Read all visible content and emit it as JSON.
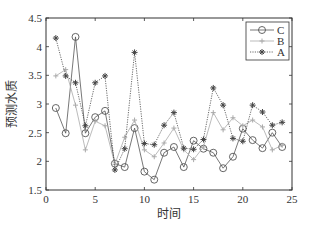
{
  "chart_data": {
    "type": "line",
    "title": "",
    "xlabel": "时间",
    "ylabel": "预测水质",
    "xlim": [
      0,
      25
    ],
    "ylim": [
      1.5,
      4.5
    ],
    "xticks": [
      0,
      5,
      10,
      15,
      20,
      25
    ],
    "yticks": [
      1.5,
      2,
      2.5,
      3,
      3.5,
      4,
      4.5
    ],
    "ytick_labels": [
      "1.5",
      "2",
      "2.5",
      "3",
      "3.5",
      "4",
      "4.5"
    ],
    "grid": false,
    "legend_position": "upper right",
    "x": [
      1,
      2,
      3,
      4,
      5,
      6,
      7,
      8,
      9,
      10,
      11,
      12,
      13,
      14,
      15,
      16,
      17,
      18,
      19,
      20,
      21,
      22,
      23,
      24
    ],
    "series": [
      {
        "name": "C",
        "marker": "circle",
        "color": "#555555",
        "line_style": "solid",
        "values": [
          2.93,
          2.49,
          4.17,
          2.49,
          2.77,
          2.88,
          1.96,
          1.9,
          2.58,
          1.82,
          1.68,
          2.15,
          2.25,
          1.9,
          2.36,
          2.22,
          2.15,
          1.88,
          2.08,
          2.57,
          2.37,
          2.23,
          2.5,
          2.25
        ]
      },
      {
        "name": "B",
        "marker": "plus",
        "color": "#aaaaaa",
        "line_style": "solid",
        "values": [
          3.49,
          3.6,
          2.98,
          2.2,
          2.7,
          2.62,
          1.95,
          2.42,
          2.72,
          2.2,
          2.08,
          2.32,
          2.58,
          2.2,
          2.03,
          2.25,
          2.85,
          2.55,
          2.76,
          2.62,
          2.72,
          2.6,
          2.2,
          2.28
        ]
      },
      {
        "name": "A",
        "marker": "star",
        "color": "#444444",
        "line_style": "dotted",
        "values": [
          4.15,
          3.49,
          3.37,
          2.62,
          3.37,
          3.49,
          1.85,
          2.22,
          3.9,
          2.31,
          2.29,
          2.63,
          2.85,
          2.23,
          2.21,
          2.38,
          3.28,
          2.98,
          2.4,
          2.35,
          2.98,
          2.86,
          2.63,
          2.68
        ]
      }
    ]
  }
}
